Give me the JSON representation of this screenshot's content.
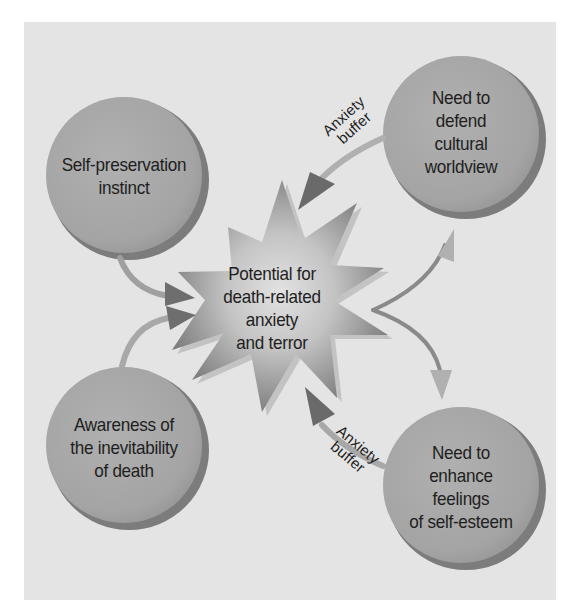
{
  "diagram": {
    "title": "",
    "center": {
      "label": "Potential for\ndeath-related\nanxiety\nand terror",
      "shape": "starburst"
    },
    "nodes": [
      {
        "id": "self-preservation",
        "label": "Self-preservation\ninstinct",
        "position": "top-left"
      },
      {
        "id": "cultural-worldview",
        "label": "Need to\ndefend\ncultural\nworldview",
        "position": "top-right"
      },
      {
        "id": "awareness-of-death",
        "label": "Awareness of\nthe inevitability\nof death",
        "position": "bottom-left"
      },
      {
        "id": "self-esteem",
        "label": "Need to\nenhance\nfeelings\nof self-esteem",
        "position": "bottom-right"
      }
    ],
    "edges": [
      {
        "from": "self-preservation",
        "to": "center",
        "label": ""
      },
      {
        "from": "awareness-of-death",
        "to": "center",
        "label": ""
      },
      {
        "from": "center",
        "to": "cultural-worldview",
        "label": ""
      },
      {
        "from": "center",
        "to": "self-esteem",
        "label": ""
      },
      {
        "from": "cultural-worldview",
        "to": "center",
        "label": "Anxiety\nbuffer"
      },
      {
        "from": "self-esteem",
        "to": "center",
        "label": "Anxiety\nbuffer"
      }
    ],
    "buffer_labels": {
      "top": "Anxiety\nbuffer",
      "bottom": "Anxiety\nbuffer"
    },
    "colors": {
      "background": "#e4e4e4",
      "circle_fill": "#a9a9a9",
      "circle_shadow": "#7c7c7c",
      "star_dark": "#8a8a8a",
      "star_light": "#d6d6d6",
      "arrow_dark": "#6e6e6e",
      "arrow_light": "#b4b4b4",
      "text": "#1e1e1e"
    }
  }
}
